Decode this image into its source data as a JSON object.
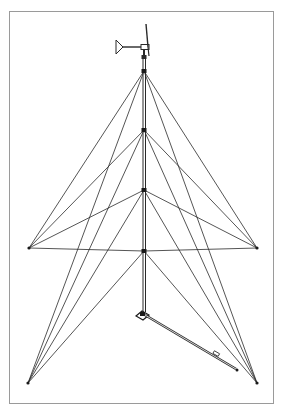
{
  "diagram": {
    "title": "",
    "colors": {
      "line": "#2a2a2a",
      "frame": "#9a9a9a",
      "background": "#ffffff"
    },
    "tower": {
      "x": 144,
      "top": 40,
      "bottom": 312
    },
    "nodes": [
      {
        "id": "n1",
        "x": 144,
        "y": 71
      },
      {
        "id": "n2",
        "x": 144,
        "y": 130
      },
      {
        "id": "n3",
        "x": 144,
        "y": 190
      },
      {
        "id": "n4",
        "x": 144,
        "y": 251
      }
    ],
    "anchors": [
      {
        "id": "left-mid",
        "x": 29,
        "y": 248
      },
      {
        "id": "right-mid",
        "x": 257,
        "y": 248
      },
      {
        "id": "left-bottom",
        "x": 28,
        "y": 383
      },
      {
        "id": "right-bottom",
        "x": 257,
        "y": 383
      }
    ],
    "gin_pole": {
      "x1": 143,
      "y1": 315,
      "x2": 237,
      "y2": 370
    },
    "turbine": {
      "hub_x": 145,
      "hub_y": 46
    }
  }
}
